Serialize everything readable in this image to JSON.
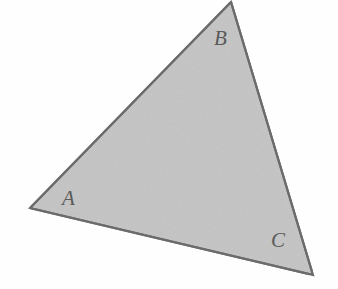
{
  "figure": {
    "kind": "triangle",
    "canvas": {
      "width": 338,
      "height": 289
    },
    "background_color": "#fefefe",
    "fill_color": "#c4c4c4",
    "stroke_color": "#6b6b6b",
    "stroke_width": 2.2,
    "label_color": "#5a5a5a",
    "vertices": [
      {
        "name": "A",
        "x": 30,
        "y": 208
      },
      {
        "name": "B",
        "x": 231,
        "y": 2
      },
      {
        "name": "C",
        "x": 313,
        "y": 275
      }
    ],
    "polygon_points": "30,208 231,2 313,275",
    "labels": [
      {
        "id": "A",
        "text": "A",
        "x": 62,
        "y": 188
      },
      {
        "id": "B",
        "text": "B",
        "x": 214,
        "y": 28
      },
      {
        "id": "C",
        "text": "C",
        "x": 271,
        "y": 230
      }
    ],
    "edges": [
      {
        "from": "A",
        "to": "B"
      },
      {
        "from": "B",
        "to": "C"
      },
      {
        "from": "C",
        "to": "A"
      }
    ]
  }
}
